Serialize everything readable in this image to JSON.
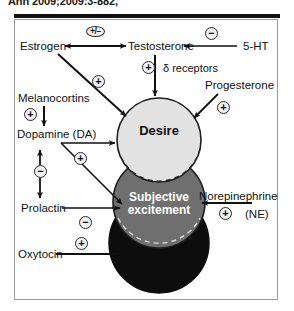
{
  "citation": {
    "text": "Ann 2009;2009:3-882,"
  },
  "figure": {
    "panel_border_color": "#9a9a9a",
    "rule_color": "#111111"
  },
  "circles": [
    {
      "id": "desire",
      "label": "Desire",
      "fill": "#e2e2e2",
      "stroke": "#1d1d1d",
      "text_color": "#111111"
    },
    {
      "id": "subjective-excitement",
      "label": "Subjective excitement",
      "label_line1": "Subjective",
      "label_line2": "excitement",
      "fill": "#6f6f6f",
      "stroke": "#1d1d1d",
      "text_color": "#ffffff"
    },
    {
      "id": "orgasm",
      "label": "",
      "fill": "#0d0d0d",
      "stroke": "#0d0d0d",
      "text_color": "#ffffff"
    }
  ],
  "nodes": {
    "estrogen": "Estrogen",
    "testosterone": "Testosterone",
    "serotonin": "5-HT",
    "delta_receptors": "δ receptors",
    "progesterone": "Progesterone",
    "melanocortins": "Melanocortins",
    "dopamine": "Dopamine (DA)",
    "prolactin": "Prolactin",
    "norepinephrine": "Norepinephrine",
    "norepinephrine_abbr": "(NE)",
    "oxytocin": "Oxytocin"
  },
  "signs": {
    "estrogen_testosterone": "+/−",
    "serotonin_testosterone": "−",
    "delta_receptors": "+",
    "estrogen_desire": "+",
    "progesterone_desire": "+",
    "melanocortins_dopamine": "+",
    "dopamine_outputs": "+",
    "dopamine_prolactin": "−",
    "prolactin_subjective": "−",
    "norepinephrine_subjective": "+",
    "oxytocin_orgasm": "+"
  },
  "edges": [
    {
      "from": "Estrogen",
      "to": "Testosterone",
      "sign": "+/−",
      "style": "bidirectional"
    },
    {
      "from": "5-HT",
      "to": "Testosterone",
      "sign": "−",
      "style": "directed"
    },
    {
      "from": "Testosterone",
      "to": "Desire",
      "sign": "+",
      "note": "δ receptors",
      "style": "directed"
    },
    {
      "from": "Estrogen",
      "to": "Desire",
      "sign": "+",
      "style": "directed"
    },
    {
      "from": "Progesterone",
      "to": "Desire",
      "sign": "+",
      "style": "directed"
    },
    {
      "from": "Melanocortins",
      "to": "Dopamine (DA)",
      "sign": "+",
      "style": "directed"
    },
    {
      "from": "Dopamine (DA)",
      "to": "Desire",
      "sign": "+",
      "style": "directed"
    },
    {
      "from": "Dopamine (DA)",
      "to": "Subjective excitement",
      "sign": "+",
      "style": "directed"
    },
    {
      "from": "Dopamine (DA)",
      "to": "Prolactin",
      "sign": "−",
      "style": "bidirectional"
    },
    {
      "from": "Prolactin",
      "to": "Subjective excitement",
      "sign": "−",
      "style": "directed"
    },
    {
      "from": "Norepinephrine",
      "to": "Subjective excitement",
      "sign": "+",
      "style": "directed"
    },
    {
      "from": "Oxytocin",
      "to": "Orgasm",
      "sign": "+",
      "style": "directed"
    }
  ]
}
